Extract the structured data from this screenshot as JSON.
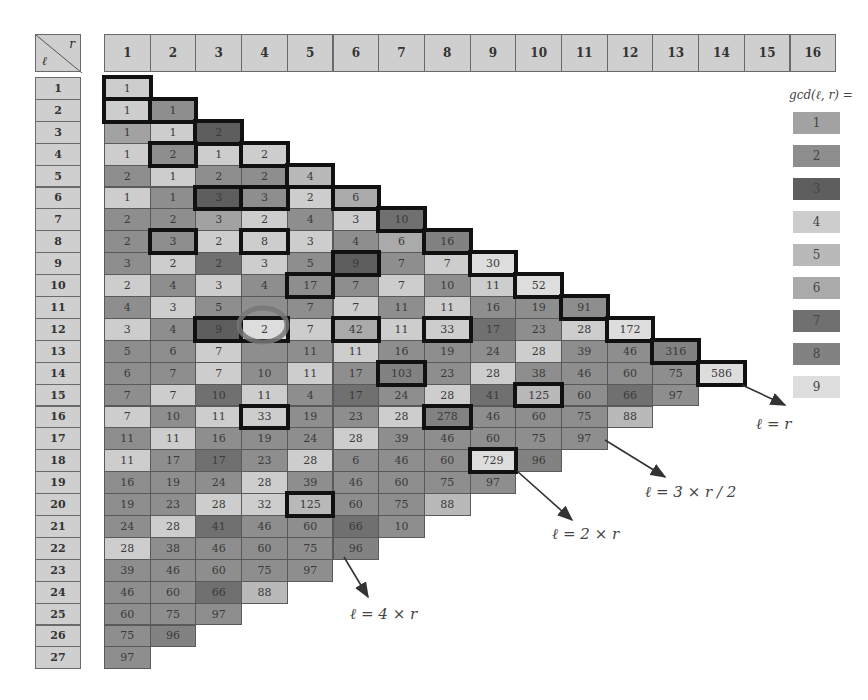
{
  "corner": {
    "top_right_label": "r",
    "bottom_left_label": "ℓ"
  },
  "column_headers": [
    "1",
    "2",
    "3",
    "4",
    "5",
    "6",
    "7",
    "8",
    "9",
    "10",
    "11",
    "12",
    "13",
    "14",
    "15",
    "16"
  ],
  "row_headers": [
    "1",
    "2",
    "3",
    "4",
    "5",
    "6",
    "7",
    "8",
    "9",
    "10",
    "11",
    "12",
    "13",
    "14",
    "15",
    "16",
    "17",
    "18",
    "19",
    "20",
    "21",
    "22",
    "23",
    "24",
    "25",
    "26",
    "27"
  ],
  "legend": {
    "title": "gcd(ℓ, r) =",
    "items": [
      {
        "label": "1",
        "color": "#a2a2a2"
      },
      {
        "label": "2",
        "color": "#8e8e8e"
      },
      {
        "label": "3",
        "color": "#5e5e5e"
      },
      {
        "label": "4",
        "color": "#cdcdcd"
      },
      {
        "label": "5",
        "color": "#b9b9b9"
      },
      {
        "label": "6",
        "color": "#aaaaaa"
      },
      {
        "label": "7",
        "color": "#707070"
      },
      {
        "label": "8",
        "color": "#828282"
      },
      {
        "label": "9",
        "color": "#dddddd"
      }
    ]
  },
  "annotations": [
    {
      "label": "ℓ = r"
    },
    {
      "label": "ℓ = 3 × r / 2"
    },
    {
      "label": "ℓ = 2 × r"
    },
    {
      "label": "ℓ = 4 × r"
    }
  ],
  "rows": [
    [
      [
        "1",
        4,
        1
      ]
    ],
    [
      [
        "1",
        4,
        1
      ],
      [
        "1",
        2,
        1
      ]
    ],
    [
      [
        "1",
        1,
        0
      ],
      [
        "1",
        4,
        0
      ],
      [
        "2",
        3,
        1
      ]
    ],
    [
      [
        "1",
        4,
        0
      ],
      [
        "2",
        2,
        1
      ],
      [
        "1",
        4,
        0
      ],
      [
        "2",
        4,
        1
      ]
    ],
    [
      [
        "2",
        2,
        0
      ],
      [
        "1",
        4,
        0
      ],
      [
        "2",
        2,
        0
      ],
      [
        "2",
        2,
        0
      ],
      [
        "4",
        5,
        1
      ]
    ],
    [
      [
        "1",
        4,
        0
      ],
      [
        "1",
        2,
        0
      ],
      [
        "3",
        3,
        1
      ],
      [
        "3",
        2,
        1
      ],
      [
        "2",
        4,
        0
      ],
      [
        "6",
        6,
        1
      ]
    ],
    [
      [
        "2",
        2,
        0
      ],
      [
        "2",
        2,
        0
      ],
      [
        "3",
        1,
        0
      ],
      [
        "2",
        4,
        0
      ],
      [
        "4",
        2,
        0
      ],
      [
        "3",
        4,
        0
      ],
      [
        "10",
        7,
        1
      ]
    ],
    [
      [
        "2",
        2,
        0
      ],
      [
        "3",
        2,
        1
      ],
      [
        "2",
        4,
        0
      ],
      [
        "8",
        4,
        1
      ],
      [
        "3",
        4,
        0
      ],
      [
        "4",
        2,
        0
      ],
      [
        "6",
        6,
        0
      ],
      [
        "16",
        8,
        1
      ]
    ],
    [
      [
        "3",
        2,
        0
      ],
      [
        "2",
        4,
        0
      ],
      [
        "2",
        7,
        0
      ],
      [
        "3",
        4,
        0
      ],
      [
        "5",
        2,
        0
      ],
      [
        "9",
        3,
        1
      ],
      [
        "7",
        2,
        0
      ],
      [
        "7",
        4,
        0
      ],
      [
        "30",
        9,
        1
      ]
    ],
    [
      [
        "2",
        4,
        0
      ],
      [
        "4",
        2,
        0
      ],
      [
        "3",
        4,
        0
      ],
      [
        "4",
        2,
        0
      ],
      [
        "17",
        2,
        1
      ],
      [
        "7",
        2,
        0
      ],
      [
        "7",
        4,
        0
      ],
      [
        "10",
        2,
        0
      ],
      [
        "11",
        4,
        0
      ],
      [
        "52",
        9,
        1
      ]
    ],
    [
      [
        "4",
        2,
        0
      ],
      [
        "3",
        4,
        0
      ],
      [
        "5",
        2,
        0
      ],
      [
        "",
        2,
        0
      ],
      [
        "7",
        2,
        0
      ],
      [
        "7",
        4,
        0
      ],
      [
        "11",
        2,
        0
      ],
      [
        "11",
        4,
        0
      ],
      [
        "16",
        2,
        0
      ],
      [
        "19",
        2,
        0
      ],
      [
        "91",
        2,
        1
      ]
    ],
    [
      [
        "3",
        4,
        0
      ],
      [
        "4",
        2,
        0
      ],
      [
        "9",
        3,
        1
      ],
      [
        "2",
        9,
        1
      ],
      [
        "7",
        4,
        0
      ],
      [
        "42",
        6,
        1
      ],
      [
        "11",
        4,
        0
      ],
      [
        "33",
        4,
        1
      ],
      [
        "17",
        7,
        0
      ],
      [
        "23",
        2,
        0
      ],
      [
        "28",
        4,
        0
      ],
      [
        "172",
        9,
        1
      ]
    ],
    [
      [
        "5",
        2,
        0
      ],
      [
        "6",
        2,
        0
      ],
      [
        "7",
        4,
        0
      ],
      [
        "",
        2,
        0
      ],
      [
        "11",
        2,
        0
      ],
      [
        "11",
        4,
        0
      ],
      [
        "16",
        2,
        0
      ],
      [
        "19",
        2,
        0
      ],
      [
        "24",
        2,
        0
      ],
      [
        "28",
        4,
        0
      ],
      [
        "39",
        2,
        0
      ],
      [
        "46",
        2,
        0
      ],
      [
        "316",
        8,
        1
      ]
    ],
    [
      [
        "6",
        2,
        0
      ],
      [
        "7",
        2,
        0
      ],
      [
        "7",
        4,
        0
      ],
      [
        "10",
        2,
        0
      ],
      [
        "11",
        4,
        0
      ],
      [
        "17",
        2,
        0
      ],
      [
        "103",
        8,
        1
      ],
      [
        "23",
        2,
        0
      ],
      [
        "28",
        4,
        0
      ],
      [
        "38",
        2,
        0
      ],
      [
        "46",
        2,
        0
      ],
      [
        "60",
        2,
        0
      ],
      [
        "75",
        2,
        0
      ],
      [
        "586",
        9,
        1
      ]
    ],
    [
      [
        "7",
        2,
        0
      ],
      [
        "7",
        4,
        0
      ],
      [
        "10",
        7,
        0
      ],
      [
        "11",
        4,
        0
      ],
      [
        "4",
        2,
        0
      ],
      [
        "17",
        7,
        0
      ],
      [
        "24",
        2,
        0
      ],
      [
        "28",
        4,
        0
      ],
      [
        "41",
        7,
        0
      ],
      [
        "125",
        5,
        1
      ],
      [
        "60",
        2,
        0
      ],
      [
        "66",
        7,
        0
      ],
      [
        "97",
        2,
        0
      ]
    ],
    [
      [
        "7",
        4,
        0
      ],
      [
        "10",
        2,
        0
      ],
      [
        "11",
        4,
        0
      ],
      [
        "33",
        4,
        1
      ],
      [
        "19",
        2,
        0
      ],
      [
        "23",
        2,
        0
      ],
      [
        "28",
        4,
        0
      ],
      [
        "278",
        8,
        1
      ],
      [
        "46",
        2,
        0
      ],
      [
        "60",
        2,
        0
      ],
      [
        "75",
        2,
        0
      ],
      [
        "88",
        5,
        0
      ]
    ],
    [
      [
        "11",
        2,
        0
      ],
      [
        "11",
        4,
        0
      ],
      [
        "16",
        2,
        0
      ],
      [
        "19",
        2,
        0
      ],
      [
        "24",
        2,
        0
      ],
      [
        "28",
        4,
        0
      ],
      [
        "39",
        2,
        0
      ],
      [
        "46",
        2,
        0
      ],
      [
        "60",
        2,
        0
      ],
      [
        "75",
        2,
        0
      ],
      [
        "97",
        2,
        0
      ]
    ],
    [
      [
        "11",
        4,
        0
      ],
      [
        "17",
        2,
        0
      ],
      [
        "17",
        7,
        0
      ],
      [
        "23",
        2,
        0
      ],
      [
        "28",
        4,
        0
      ],
      [
        "6",
        2,
        0
      ],
      [
        "46",
        2,
        0
      ],
      [
        "60",
        2,
        0
      ],
      [
        "729",
        9,
        1
      ],
      [
        "96",
        8,
        0
      ]
    ],
    [
      [
        "16",
        2,
        0
      ],
      [
        "19",
        2,
        0
      ],
      [
        "24",
        2,
        0
      ],
      [
        "28",
        4,
        0
      ],
      [
        "39",
        2,
        0
      ],
      [
        "46",
        2,
        0
      ],
      [
        "60",
        2,
        0
      ],
      [
        "75",
        2,
        0
      ],
      [
        "97",
        2,
        0
      ]
    ],
    [
      [
        "19",
        2,
        0
      ],
      [
        "23",
        2,
        0
      ],
      [
        "28",
        4,
        0
      ],
      [
        "32",
        4,
        0
      ],
      [
        "125",
        5,
        1
      ],
      [
        "60",
        2,
        0
      ],
      [
        "75",
        2,
        0
      ],
      [
        "88",
        5,
        0
      ]
    ],
    [
      [
        "24",
        2,
        0
      ],
      [
        "28",
        4,
        0
      ],
      [
        "41",
        7,
        0
      ],
      [
        "46",
        2,
        0
      ],
      [
        "60",
        2,
        0
      ],
      [
        "66",
        7,
        0
      ],
      [
        "10",
        2,
        0
      ]
    ],
    [
      [
        "28",
        4,
        0
      ],
      [
        "38",
        2,
        0
      ],
      [
        "46",
        2,
        0
      ],
      [
        "60",
        2,
        0
      ],
      [
        "75",
        2,
        0
      ],
      [
        "96",
        8,
        0
      ]
    ],
    [
      [
        "39",
        2,
        0
      ],
      [
        "46",
        2,
        0
      ],
      [
        "60",
        2,
        0
      ],
      [
        "75",
        2,
        0
      ],
      [
        "97",
        2,
        0
      ]
    ],
    [
      [
        "46",
        2,
        0
      ],
      [
        "60",
        2,
        0
      ],
      [
        "66",
        7,
        0
      ],
      [
        "88",
        5,
        0
      ]
    ],
    [
      [
        "60",
        2,
        0
      ],
      [
        "75",
        2,
        0
      ],
      [
        "97",
        2,
        0
      ]
    ],
    [
      [
        "75",
        2,
        0
      ],
      [
        "96",
        8,
        0
      ]
    ],
    [
      [
        "97",
        2,
        0
      ]
    ]
  ]
}
